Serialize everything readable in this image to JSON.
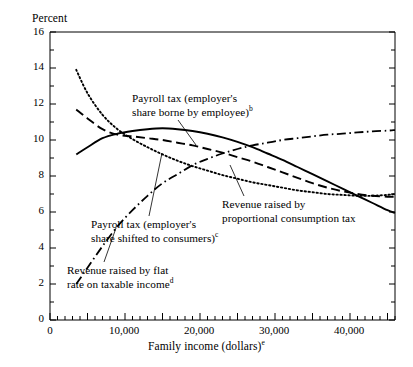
{
  "chart_data": {
    "type": "line",
    "title": "",
    "xlabel": "Family income (dollars)",
    "xlabel_superscript": "e",
    "ylabel": "Percent",
    "xlim": [
      0,
      46000
    ],
    "ylim": [
      0,
      16
    ],
    "grid": false,
    "legend_position": "inline-annotations",
    "x_ticks_major": [
      0,
      10000,
      20000,
      30000,
      40000
    ],
    "x_tick_labels": [
      "0",
      "10,000",
      "20,000",
      "30,000",
      "40,000"
    ],
    "x_tick_minor_step": 1000,
    "y_ticks_major": [
      0,
      2,
      4,
      6,
      8,
      10,
      12,
      14,
      16
    ],
    "y_tick_labels": [
      "0",
      "2",
      "4",
      "6",
      "8",
      "10",
      "12",
      "14",
      "16"
    ],
    "y_tick_minor_step": 1,
    "series": [
      {
        "name": "Payroll tax (employer's share borne by employee)",
        "superscript": "b",
        "style": "solid",
        "color": "#000000",
        "x": [
          3500,
          5000,
          7000,
          9000,
          11000,
          13000,
          15000,
          17000,
          19000,
          21000,
          23000,
          25000,
          27000,
          29000,
          31000,
          33000,
          35000,
          37000,
          39000,
          41000,
          43000,
          45000,
          46000
        ],
        "y": [
          9.2,
          9.6,
          10.1,
          10.35,
          10.5,
          10.6,
          10.65,
          10.6,
          10.5,
          10.35,
          10.15,
          9.9,
          9.6,
          9.25,
          8.9,
          8.5,
          8.1,
          7.7,
          7.3,
          6.9,
          6.5,
          6.1,
          5.95
        ]
      },
      {
        "name": "Payroll tax (employer's share shifted to consumers)",
        "superscript": "c",
        "style": "dash-dot",
        "color": "#000000",
        "x": [
          3500,
          5000,
          7000,
          9000,
          11000,
          13000,
          15000,
          17000,
          19000,
          21000,
          23000,
          25000,
          27000,
          29000,
          31000,
          33000,
          35000,
          37000,
          39000,
          41000,
          43000,
          45000,
          46000
        ],
        "y": [
          2.0,
          2.9,
          4.1,
          5.2,
          6.1,
          6.9,
          7.6,
          8.1,
          8.6,
          8.95,
          9.25,
          9.5,
          9.7,
          9.85,
          10.0,
          10.1,
          10.2,
          10.3,
          10.35,
          10.42,
          10.48,
          10.52,
          10.55
        ]
      },
      {
        "name": "Revenue raised by proportional consumption tax",
        "superscript": "",
        "style": "dashed",
        "color": "#000000",
        "x": [
          3500,
          5000,
          7000,
          9000,
          11000,
          13000,
          15000,
          17000,
          19000,
          21000,
          23000,
          25000,
          27000,
          29000,
          31000,
          33000,
          35000,
          37000,
          39000,
          41000,
          43000,
          45000,
          46000
        ],
        "y": [
          11.7,
          11.2,
          10.6,
          10.3,
          10.2,
          10.1,
          10.0,
          9.85,
          9.7,
          9.5,
          9.3,
          9.05,
          8.8,
          8.5,
          8.2,
          7.9,
          7.6,
          7.35,
          7.15,
          7.0,
          6.9,
          6.85,
          6.85
        ]
      },
      {
        "name": "Revenue raised by flat rate on taxable income",
        "superscript": "d",
        "style": "dotted",
        "color": "#000000",
        "x": [
          3500,
          5000,
          7000,
          9000,
          11000,
          13000,
          15000,
          17000,
          19000,
          21000,
          23000,
          25000,
          27000,
          29000,
          31000,
          33000,
          35000,
          37000,
          39000,
          41000,
          43000,
          45000,
          46000
        ],
        "y": [
          13.9,
          12.6,
          11.4,
          10.6,
          10.05,
          9.6,
          9.2,
          8.85,
          8.55,
          8.3,
          8.05,
          7.85,
          7.65,
          7.5,
          7.35,
          7.2,
          7.1,
          7.0,
          6.95,
          6.9,
          6.9,
          6.95,
          7.0
        ]
      }
    ],
    "annotations": [
      {
        "id": "payroll-borne-by-employee",
        "line1": "Payroll tax (employer's",
        "line2": "share borne by employee)",
        "superscript": "b"
      },
      {
        "id": "payroll-shifted-to-consumers",
        "line1": "Payroll tax (employer's",
        "line2": "share shifted to consumers)",
        "superscript": "c"
      },
      {
        "id": "flat-rate-taxable-income",
        "line1": "Revenue raised by flat",
        "line2": "rate on taxable income",
        "superscript": "d"
      },
      {
        "id": "proportional-consumption-tax",
        "line1": "Revenue raised by",
        "line2": "proportional consumption tax",
        "superscript": ""
      }
    ]
  }
}
